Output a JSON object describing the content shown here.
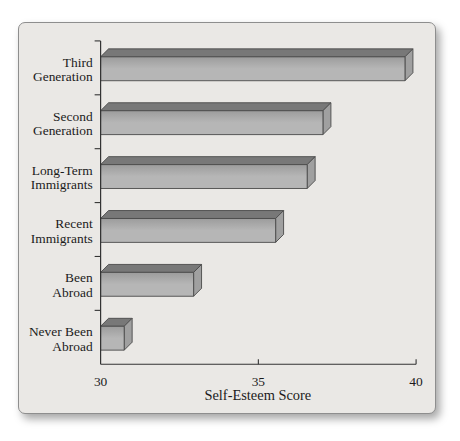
{
  "chart_data": {
    "type": "bar",
    "orientation": "horizontal",
    "style": "3d-beveled-bars",
    "categories": [
      "Third Generation",
      "Second Generation",
      "Long-Term Immigrants",
      "Recent Immigrants",
      "Been Abroad",
      "Never Been Abroad"
    ],
    "category_lines": [
      [
        "Third",
        "Generation"
      ],
      [
        "Second",
        "Generation"
      ],
      [
        "Long-Term",
        "Immigrants"
      ],
      [
        "Recent",
        "Immigrants"
      ],
      [
        "Been",
        "Abroad"
      ],
      [
        "Never Been",
        "Abroad"
      ]
    ],
    "values": [
      39.9,
      37.3,
      36.8,
      35.8,
      33.2,
      31.0
    ],
    "xlabel": "Self-Esteem Score",
    "xlim": [
      30,
      40
    ],
    "xticks": [
      30,
      35,
      40
    ],
    "grid": false,
    "legend_position": "none",
    "colors": {
      "bar_face_light": "#b6b6b6",
      "bar_face_dark": "#9c9c9c",
      "bar_top": "#787878",
      "bar_side": "#a0a0a0",
      "bar_outline": "#4a4a4a",
      "axis": "#333333",
      "text": "#1b1b1b",
      "card_background": "#eae8e5",
      "card_border": "#8e8e8e"
    }
  }
}
